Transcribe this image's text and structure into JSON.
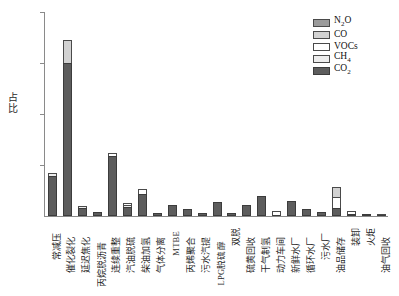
{
  "chart_data": {
    "type": "bar",
    "subtype": "stacked-bar",
    "title": "",
    "xlabel": "",
    "ylabel": "占比",
    "ylim": [
      0,
      0.4
    ],
    "ytick_labels": [
      "0.1",
      "0.2",
      "0.3",
      "0.4"
    ],
    "ytick_values": [
      0.1,
      0.2,
      0.3,
      0.4
    ],
    "grid": false,
    "legend_position": "top-right",
    "categories": [
      "常减压",
      "催化裂化",
      "延迟焦化",
      "丙烷脱沥青",
      "连续重整",
      "汽油脱硫",
      "柴油加氢",
      "气体分离",
      "MTBE",
      "丙烯聚合",
      "污水汽提",
      "LPG脱硫醇",
      "双脱",
      "硫黄回收",
      "干气制氢",
      "动力车间",
      "新鲜水厂",
      "循环水厂",
      "污水厂",
      "油品储存",
      "装卸",
      "火炬",
      "油气回收"
    ],
    "series": [
      {
        "name": "CO₂",
        "key": "co2",
        "color": "#5d5d5d",
        "values": [
          0.078,
          0.3,
          0.016,
          0.008,
          0.117,
          0.018,
          0.044,
          0.006,
          0.021,
          0.014,
          0.005,
          0.028,
          0.006,
          0.022,
          0.04,
          0.0,
          0.03,
          0.014,
          0.007,
          0.015,
          0.003,
          0.003,
          0.0
        ]
      },
      {
        "name": "CH₄",
        "key": "ch4",
        "color": "#ededed",
        "values": [
          0.007,
          0.0,
          0.001,
          0.0,
          0.0,
          0.001,
          0.0,
          0.0,
          0.0,
          0.0,
          0.0,
          0.0,
          0.0,
          0.0,
          0.0,
          0.0,
          0.0,
          0.0,
          0.0,
          0.0,
          0.0,
          0.0,
          0.0
        ]
      },
      {
        "name": "VOCs",
        "key": "vocs",
        "color": "#ffffff",
        "values": [
          0.0,
          0.0,
          0.0,
          0.0,
          0.006,
          0.004,
          0.008,
          0.0,
          0.0,
          0.0,
          0.0,
          0.0,
          0.0,
          0.0,
          0.0,
          0.01,
          0.0,
          0.0,
          0.0,
          0.022,
          0.006,
          0.0,
          0.001
        ]
      },
      {
        "name": "CO",
        "key": "co",
        "color": "#d2d2d2",
        "values": [
          0.0,
          0.045,
          0.0,
          0.0,
          0.0,
          0.0,
          0.0,
          0.0,
          0.0,
          0.0,
          0.0,
          0.0,
          0.0,
          0.0,
          0.0,
          0.0,
          0.0,
          0.0,
          0.0,
          0.019,
          0.0,
          0.0,
          0.0
        ]
      },
      {
        "name": "N₂O",
        "key": "n2o",
        "color": "#9b9b9b",
        "values": [
          0.0,
          0.0,
          0.0,
          0.0,
          0.0,
          0.0,
          0.0,
          0.0,
          0.0,
          0.0,
          0.0,
          0.0,
          0.0,
          0.0,
          0.0,
          0.0,
          0.0,
          0.0,
          0.0,
          0.0,
          0.0,
          0.0,
          0.0
        ]
      }
    ],
    "totals": [
      0.085,
      0.345,
      0.017,
      0.008,
      0.123,
      0.023,
      0.052,
      0.006,
      0.021,
      0.014,
      0.005,
      0.028,
      0.006,
      0.022,
      0.04,
      0.01,
      0.03,
      0.014,
      0.007,
      0.056,
      0.009,
      0.003,
      0.001
    ]
  },
  "legend": {
    "items": [
      {
        "label_html": "N<sub>2</sub>O",
        "swatch": "sw-n2o"
      },
      {
        "label_html": "CO",
        "swatch": "sw-co"
      },
      {
        "label_html": "VOCs",
        "swatch": "sw-vocs"
      },
      {
        "label_html": "CH<sub>4</sub>",
        "swatch": "sw-ch4"
      },
      {
        "label_html": "CO<sub>2</sub>",
        "swatch": "sw-co2"
      }
    ]
  }
}
